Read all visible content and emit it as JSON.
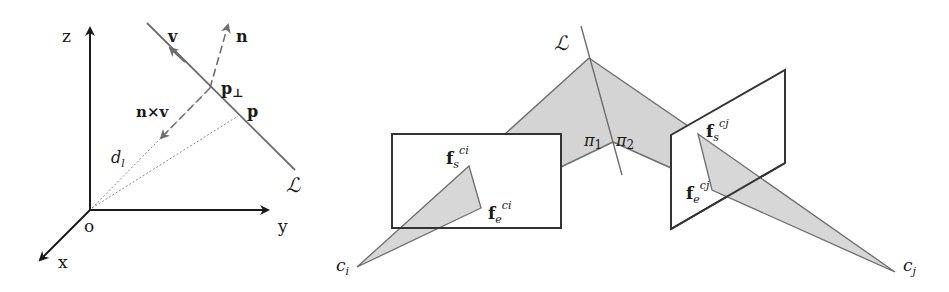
{
  "left_diagram": {
    "axes": {
      "z": "z",
      "y": "y",
      "x": "x",
      "origin": "o"
    },
    "line_label": "ℒ",
    "vectors": {
      "v": "v",
      "n": "n",
      "nxv": "n×v"
    },
    "points": {
      "p_perp": "p",
      "p_perp_sub": "⊥",
      "p": "p"
    },
    "distance": {
      "d": "d",
      "sub": "l"
    }
  },
  "right_diagram": {
    "line_label": "ℒ",
    "planes": {
      "pi1": "π",
      "pi1_sub": "1",
      "pi2": "π",
      "pi2_sub": "2"
    },
    "camera_i": {
      "c": "c",
      "sub": "i",
      "fs": "f",
      "fs_sub": "s",
      "fs_sup": "ci",
      "fe": "f",
      "fe_sub": "e",
      "fe_sup": "ci"
    },
    "camera_j": {
      "c": "c",
      "sub": "j",
      "fs": "f",
      "fs_sub": "s",
      "fs_sup": "cj",
      "fe": "f",
      "fe_sub": "e",
      "fe_sup": "cj"
    }
  },
  "colors": {
    "ink": "#1a1a1a",
    "gray_line": "#6e6e6e",
    "shade": "#d4d4d4",
    "dotted": "#8a8a8a"
  }
}
